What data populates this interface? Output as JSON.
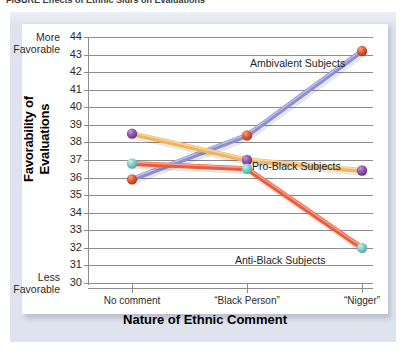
{
  "caption": {
    "text": "FIGURE   Effects of Ethnic Slurs on Evaluations"
  },
  "chart_data": {
    "type": "line",
    "title": "",
    "xlabel": "Nature of Ethnic Comment",
    "ylabel": "Favorability of Evaluations",
    "categories": [
      "No comment",
      "“Black Person”",
      "“Nigger”"
    ],
    "ylim": [
      30,
      44
    ],
    "yticks": [
      44,
      43,
      42,
      41,
      40,
      39,
      38,
      37,
      36,
      35,
      34,
      33,
      32,
      31,
      30
    ],
    "grid": true,
    "legend_position": "inline-annotations",
    "axis_extremes": {
      "y_top_line1": "More",
      "y_top_line2": "Favorable",
      "y_bottom_line1": "Less",
      "y_bottom_line2": "Favorable"
    },
    "series": [
      {
        "name": "Ambivalent Subjects",
        "values": [
          35.9,
          38.4,
          43.2
        ],
        "line_color": "#8c8fd4",
        "marker_color": "#d94f28",
        "label_x": 228,
        "label_y": 33
      },
      {
        "name": "Pro-Black Subjects",
        "values": [
          38.5,
          37.0,
          36.4
        ],
        "line_color": "#f2b55c",
        "marker_color": "#8e4fa8",
        "label_x": 230,
        "label_y": 136
      },
      {
        "name": "Anti-Black Subjects",
        "values": [
          36.8,
          36.5,
          32.0
        ],
        "line_color": "#ef5b38",
        "marker_color": "#76cfc0",
        "label_x": 213,
        "label_y": 230
      }
    ]
  }
}
